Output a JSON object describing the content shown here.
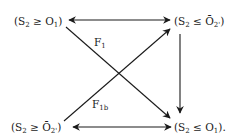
{
  "diagram": {
    "nodes": {
      "top_left": {
        "prefix": "(S",
        "sub1": "2",
        "op": " ≥ ",
        "var": "O",
        "bar": false,
        "sub2": "1",
        "suffix": ")"
      },
      "top_right": {
        "prefix": "(S",
        "sub1": "2",
        "op": " ≤ ",
        "var": "Ō",
        "bar": true,
        "sub2": "2'",
        "suffix": ")"
      },
      "bottom_left": {
        "prefix": "(S",
        "sub1": "2",
        "op": " ≥ ",
        "var": "Ō",
        "bar": true,
        "sub2": "2'",
        "suffix": ")"
      },
      "bottom_right": {
        "prefix": "(S",
        "sub1": "2",
        "op": " ≤ ",
        "var": "O",
        "bar": false,
        "sub2": "1",
        "suffix": ")."
      }
    },
    "edges": {
      "f1": {
        "label": "F",
        "sub": "1",
        "from": "top_left",
        "to": "bottom_right"
      },
      "f1b": {
        "label": "F",
        "sub": "1b",
        "from": "bottom_left",
        "to": "top_right"
      },
      "top": {
        "from": "top_left",
        "to": "top_right",
        "bidirectional": true
      },
      "bottom": {
        "from": "bottom_left",
        "to": "bottom_right",
        "bidirectional": true
      },
      "right": {
        "from": "top_right",
        "to": "bottom_right",
        "bidirectional": false
      }
    },
    "colors": {
      "ink": "#1a1a1a",
      "background": "#ffffff"
    }
  }
}
